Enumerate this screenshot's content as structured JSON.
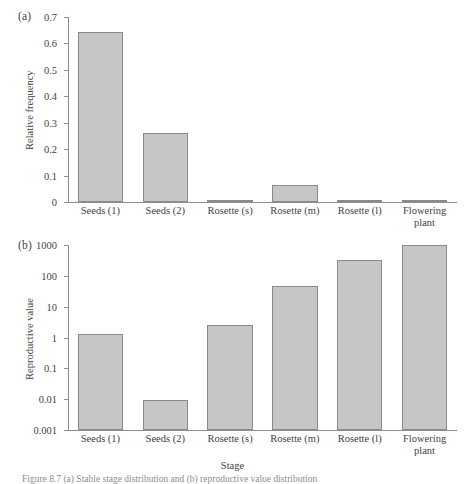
{
  "figure": {
    "caption": "Figure 8.7  (a) Stable stage distribution and (b) reproductive value distribution"
  },
  "panels": [
    {
      "tag": "(a)",
      "ylabel": "Relative frequency",
      "xlabel": "",
      "yticks": [
        "0",
        "0.1",
        "0.2",
        "0.3",
        "0.4",
        "0.5",
        "0.6",
        "0.7"
      ]
    },
    {
      "tag": "(b)",
      "ylabel": "Reproductive value",
      "xlabel": "Stage",
      "yticks": [
        "0.001",
        "0.01",
        "0.1",
        "1",
        "10",
        "100",
        "1000"
      ]
    }
  ],
  "categories": [
    "Seeds (1)",
    "Seeds (2)",
    "Rosette (s)",
    "Rosette (m)",
    "Rosette (l)",
    "Flowering plant"
  ],
  "colors": {
    "bar_fill": "#c6c6c6",
    "bar_stroke": "#8a8a8a",
    "axis": "#8e8e8e",
    "text": "#3f3f3f"
  },
  "chart_data": [
    {
      "type": "bar",
      "title": "(a)",
      "categories": [
        "Seeds (1)",
        "Seeds (2)",
        "Rosette (s)",
        "Rosette (m)",
        "Rosette (l)",
        "Flowering plant"
      ],
      "values": [
        0.642,
        0.261,
        0.008,
        0.066,
        0.007,
        0.004
      ],
      "xlabel": "",
      "ylabel": "Relative frequency",
      "ylim": [
        0,
        0.7
      ],
      "yticks": [
        0,
        0.1,
        0.2,
        0.3,
        0.4,
        0.5,
        0.6,
        0.7
      ],
      "yscale": "linear",
      "grid": false,
      "legend": "none"
    },
    {
      "type": "bar",
      "title": "(b)",
      "categories": [
        "Seeds (1)",
        "Seeds (2)",
        "Rosette (s)",
        "Rosette (m)",
        "Rosette (l)",
        "Flowering plant"
      ],
      "values": [
        1.3,
        0.0095,
        2.6,
        48,
        320,
        1000
      ],
      "xlabel": "Stage",
      "ylabel": "Reproductive value",
      "ylim": [
        0.001,
        1000
      ],
      "yticks": [
        0.001,
        0.01,
        0.1,
        1,
        10,
        100,
        1000
      ],
      "yscale": "log",
      "grid": false,
      "legend": "none"
    }
  ]
}
